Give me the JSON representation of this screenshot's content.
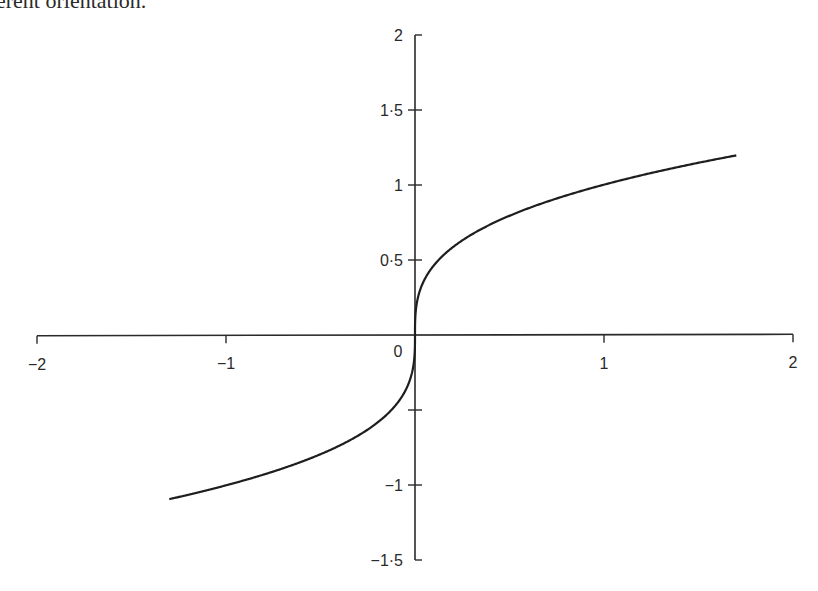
{
  "caption_fragment": "erent orientation.",
  "chart_data": {
    "type": "line",
    "title": "",
    "xlabel": "",
    "ylabel": "",
    "function": "y = x^(1/3) (cube root)",
    "xlim": [
      -2,
      2
    ],
    "ylim": [
      -1.5,
      2
    ],
    "grid": false,
    "legend": null,
    "x_ticks": [
      -2,
      -1,
      0,
      1,
      2
    ],
    "x_tick_labels": [
      "−2",
      "−1",
      "0",
      "1",
      "2"
    ],
    "y_ticks": [
      -1.5,
      -1,
      -0.5,
      0.5,
      1,
      1.5,
      2
    ],
    "y_tick_labels": [
      "−1·5",
      "−1",
      "",
      "0·5",
      "1",
      "1·5",
      "2"
    ],
    "origin_label": "0",
    "series": [
      {
        "name": "cube root",
        "x_range": [
          -1.3,
          1.7
        ],
        "x": [
          -1.3,
          -1.0,
          -0.5,
          -0.2,
          -0.05,
          0,
          0.05,
          0.2,
          0.5,
          1.0,
          1.5,
          1.7
        ],
        "y": [
          -1.09,
          -1.0,
          -0.79,
          -0.58,
          -0.37,
          0,
          0.37,
          0.58,
          0.79,
          1.0,
          1.14,
          1.19
        ]
      }
    ]
  },
  "colors": {
    "axis": "#2a2a2a",
    "curve": "#1e1e1e",
    "background": "#ffffff"
  }
}
